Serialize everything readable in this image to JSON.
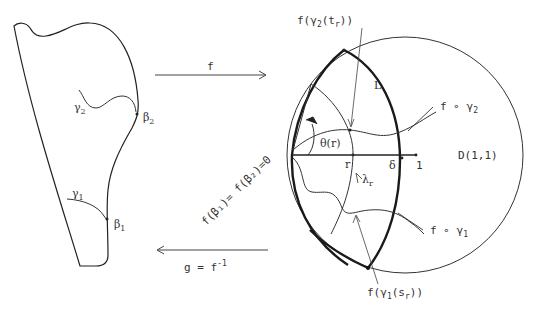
{
  "diagram": {
    "left_domain": {
      "curves": [
        {
          "name": "gamma_2",
          "label": "γ",
          "subscript": "2"
        },
        {
          "name": "gamma_1",
          "label": "γ",
          "subscript": "1"
        }
      ],
      "points": [
        {
          "name": "beta_2",
          "label": "β",
          "subscript": "2"
        },
        {
          "name": "beta_1",
          "label": "β",
          "subscript": "1"
        }
      ]
    },
    "maps": {
      "forward": {
        "label": "f"
      },
      "inverse": {
        "label": "g = f",
        "superscript": "-1"
      }
    },
    "right_domain": {
      "disk_label": "D(1,1)",
      "region_label": "L",
      "origin_label": "f(β₁)= f(β₂)=0",
      "angle_label": "θ(r)",
      "axis_points": [
        {
          "name": "r",
          "label": "r"
        },
        {
          "name": "delta",
          "label": "δ"
        },
        {
          "name": "one",
          "label": "1"
        }
      ],
      "arc_label": {
        "label": "λ",
        "subscript": "r"
      },
      "image_curves": [
        {
          "name": "f-gamma-2",
          "label": "f ∘ γ",
          "subscript": "2"
        },
        {
          "name": "f-gamma-1",
          "label": "f ∘ γ",
          "subscript": "1"
        }
      ],
      "callouts": [
        {
          "name": "f-gamma2-tr",
          "prefix": "f(γ",
          "sub1": "2",
          "mid": "(t",
          "sub2": "r",
          "suffix": "))"
        },
        {
          "name": "f-gamma1-sr",
          "prefix": "f(γ",
          "sub1": "1",
          "mid": "(s",
          "sub2": "r",
          "suffix": "))"
        }
      ]
    },
    "colors": {
      "ink": "#333333",
      "background": "#ffffff"
    }
  }
}
